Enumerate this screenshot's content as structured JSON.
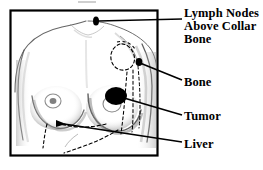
{
  "figure": {
    "type": "medical-anatomical-diagram",
    "frame": {
      "border_color": "#000000",
      "background_color": "#ffffff",
      "x": 10,
      "y": 10,
      "width": 148,
      "height": 146
    },
    "body_outline_color": "#3a3a3a",
    "shading_color": "#9a9a9a",
    "marker_color": "#000000",
    "leader_line_color": "#000000",
    "dashed_channel_color": "#000000"
  },
  "labels": [
    {
      "id": "lymph-nodes",
      "name": "lymph-nodes-label",
      "lines": [
        "Lymph Nodes",
        "Above Collar",
        "Bone"
      ],
      "line1": "Lymph Nodes",
      "line2": "Above Collar",
      "line3": "Bone",
      "leader": {
        "from_x": 96,
        "from_y": 22,
        "to_x": 182,
        "to_y": 19
      },
      "marker": {
        "x": 96,
        "y": 21,
        "rx": 3,
        "ry": 4.5,
        "shape": "ellipse"
      }
    },
    {
      "id": "bone",
      "name": "bone-label",
      "text": "Bone",
      "leader": {
        "from_x": 139,
        "from_y": 62,
        "to_x": 182,
        "to_y": 80
      },
      "marker": {
        "x": 139,
        "y": 62,
        "rx": 3.5,
        "ry": 4,
        "shape": "ellipse"
      }
    },
    {
      "id": "tumor",
      "name": "tumor-label",
      "text": "Tumor",
      "leader": {
        "from_x": 124,
        "from_y": 98,
        "to_x": 182,
        "to_y": 115
      },
      "marker": {
        "x": 116,
        "y": 96,
        "rx": 11,
        "ry": 9,
        "shape": "ellipse"
      }
    },
    {
      "id": "liver",
      "name": "liver-label",
      "text": "Liver",
      "leader": {
        "from_x": 62,
        "from_y": 124,
        "to_x": 182,
        "to_y": 142
      },
      "marker": {
        "x": 60,
        "y": 123,
        "rx": 5,
        "ry": 3,
        "shape": "ellipse"
      }
    }
  ],
  "anatomy": {
    "axillary_node_loop": "dashed circular loop at left armpit representing axillary lymph nodes",
    "lymph_channels": "dashed lines running down the side of the torso and under the breast"
  }
}
